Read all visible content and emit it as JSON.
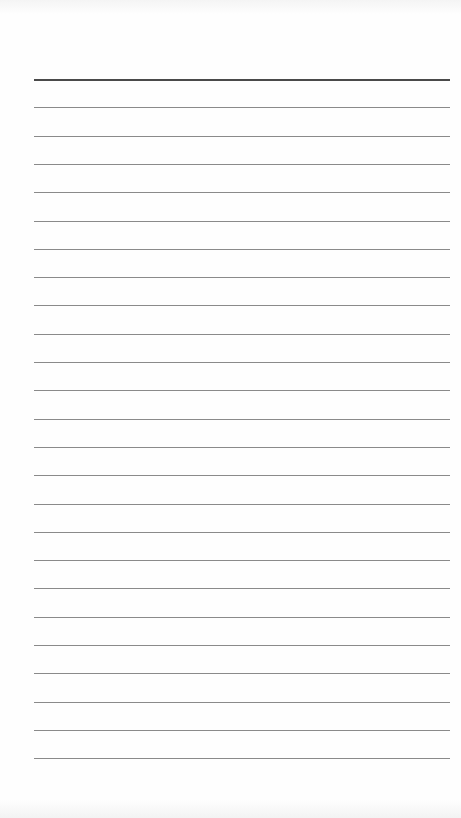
{
  "page": {
    "type": "lined-paper",
    "background_color": "#fefefe",
    "rules": {
      "count": 25,
      "first_y": 79,
      "spacing": 28.3,
      "left": 34,
      "width": 416,
      "header_rule_color": "#4a4a4a",
      "rule_color": "#8a8a8a"
    }
  }
}
